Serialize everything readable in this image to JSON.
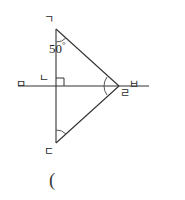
{
  "figure": {
    "type": "geometry-diagram",
    "stroke_color": "#333333",
    "background_color": "#ffffff",
    "vertices": [
      {
        "id": "top",
        "label": "ㄱ",
        "x": 56,
        "y": 29,
        "label_x": 44,
        "label_y": 14
      },
      {
        "id": "center-left",
        "label": "ㄴ",
        "x": 56,
        "y": 86,
        "label_x": 39,
        "label_y": 73
      },
      {
        "id": "bottom",
        "label": "ㄷ",
        "x": 56,
        "y": 143,
        "label_x": 44,
        "label_y": 146
      },
      {
        "id": "right",
        "label": "ㄹ",
        "x": 119,
        "y": 86,
        "label_x": 120,
        "label_y": 88
      },
      {
        "id": "line-left-end",
        "label": "ㅁ",
        "x": 18,
        "y": 86,
        "label_x": 16,
        "label_y": 79
      },
      {
        "id": "line-right-end",
        "label": "ㅂ",
        "x": 149,
        "y": 86,
        "label_x": 129,
        "label_y": 79
      }
    ],
    "angle_label": {
      "value": "50",
      "degree_symbol": "°",
      "x": 49,
      "y": 41
    },
    "caption": "(",
    "caption_x": 49,
    "caption_y": 170,
    "right_angle_marker": {
      "x": 56,
      "y": 86,
      "size": 8,
      "quadrant": "upper-right"
    },
    "angle_arcs": [
      {
        "at": "top",
        "radius": 13
      },
      {
        "at": "bottom",
        "radius": 13
      },
      {
        "at": "right",
        "radius": 15
      }
    ],
    "segments": [
      {
        "from": "top",
        "to": "bottom"
      },
      {
        "from": "top",
        "to": "right"
      },
      {
        "from": "bottom",
        "to": "right"
      },
      {
        "from": "line-left-end",
        "to": "line-right-end"
      }
    ]
  }
}
